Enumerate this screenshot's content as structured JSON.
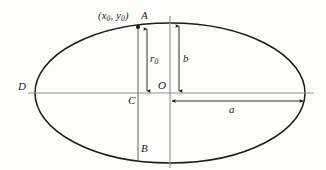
{
  "figure": {
    "type": "geometry-diagram",
    "background_color": "#fcfcfa",
    "stroke_color": "#1a1a1a",
    "axis_color": "#8a8a8a",
    "labels": {
      "point_a": "A",
      "point_b": "B",
      "point_c": "C",
      "point_d": "D",
      "point_o": "O",
      "coordinate_pair": "(x",
      "coordinate_sub1": "0",
      "coordinate_mid": ", y",
      "coordinate_sub2": "0",
      "coordinate_close": ")",
      "radius_label": "r",
      "radius_sub": "0",
      "semi_minor_label": "b",
      "semi_major_label": "a"
    },
    "geometry": {
      "center_x": 170,
      "center_y": 93,
      "semi_major_a": 135,
      "semi_minor_b": 70,
      "chord_x": 138,
      "point_a_y": 27,
      "point_b_y": 158,
      "left_vertex_x": 35,
      "right_vertex_x": 305
    }
  }
}
